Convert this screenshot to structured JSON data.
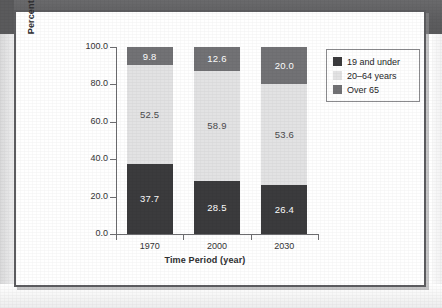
{
  "chart_data": {
    "type": "bar",
    "subtype": "stacked-bar-vertical",
    "title": "",
    "xlabel": "Time Period (year)",
    "ylabel": "Percentage of People",
    "categories": [
      "1970",
      "2000",
      "2030"
    ],
    "ylim": [
      0.0,
      100.0
    ],
    "yticks": [
      "0.0",
      "20.0",
      "40.0",
      "60.0",
      "80.0",
      "100.0"
    ],
    "ytick_values": [
      0.0,
      20.0,
      40.0,
      60.0,
      80.0,
      100.0
    ],
    "grid": false,
    "legend_position": "upper-right-outside",
    "series": [
      {
        "name": "19 and under",
        "color": "#3b3b3d",
        "values": [
          37.7,
          28.5,
          26.4
        ],
        "labels": [
          "37.7",
          "28.5",
          "26.4"
        ]
      },
      {
        "name": "20–64 years",
        "color": "#e2e2e3",
        "values": [
          52.5,
          58.9,
          53.6
        ],
        "labels": [
          "52.5",
          "58.9",
          "53.6"
        ]
      },
      {
        "name": "Over 65",
        "color": "#727275",
        "values": [
          9.8,
          12.6,
          20.0
        ],
        "labels": [
          "9.8",
          "12.6",
          "20.0"
        ]
      }
    ]
  },
  "legend": {
    "items": [
      {
        "label": "19 and under",
        "color": "#3b3b3d"
      },
      {
        "label": "20–64 years",
        "color": "#e2e2e3"
      },
      {
        "label": "Over 65",
        "color": "#727275"
      }
    ]
  },
  "axes": {
    "y_title": "Percentage of People",
    "x_title": "Time Period (year)",
    "y_labels": [
      "100.0",
      "80.0",
      "60.0",
      "40.0",
      "20.0",
      "0.0"
    ],
    "x_labels": [
      "1970",
      "2000",
      "2030"
    ]
  }
}
